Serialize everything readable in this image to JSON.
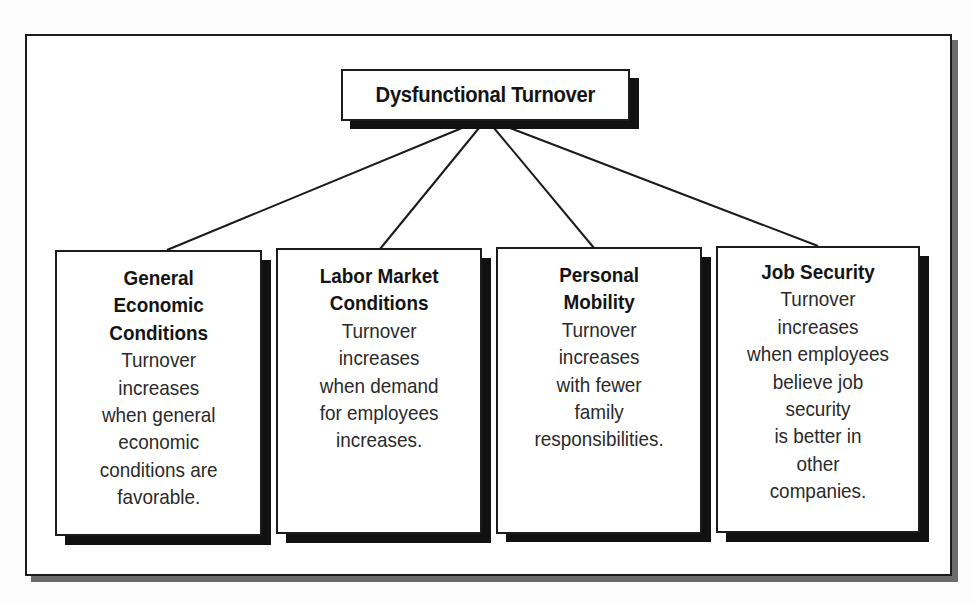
{
  "diagram": {
    "type": "hierarchy",
    "root": {
      "label": "Dysfunctional Turnover"
    },
    "factors": [
      {
        "title_lines": [
          "General",
          "Economic",
          "Conditions"
        ],
        "text_lines": [
          "Turnover",
          "increases",
          "when general",
          "economic",
          "conditions are",
          "favorable."
        ]
      },
      {
        "title_lines": [
          "Labor Market",
          "Conditions"
        ],
        "text_lines": [
          "Turnover",
          "increases",
          "when demand",
          "for employees",
          "increases."
        ]
      },
      {
        "title_lines": [
          "Personal",
          "Mobility"
        ],
        "text_lines": [
          "Turnover",
          "increases",
          "with fewer",
          "family",
          "responsibilities."
        ]
      },
      {
        "title_lines": [
          "Job Security"
        ],
        "text_lines": [
          "Turnover",
          "increases",
          "when employees",
          "believe job",
          "security",
          "is better in",
          "other",
          "companies."
        ]
      }
    ]
  },
  "colors": {
    "border": "#1c1c1c",
    "box_shadow": "#111111",
    "frame_shadow": "#6b6b6b",
    "background": "#ffffff"
  }
}
